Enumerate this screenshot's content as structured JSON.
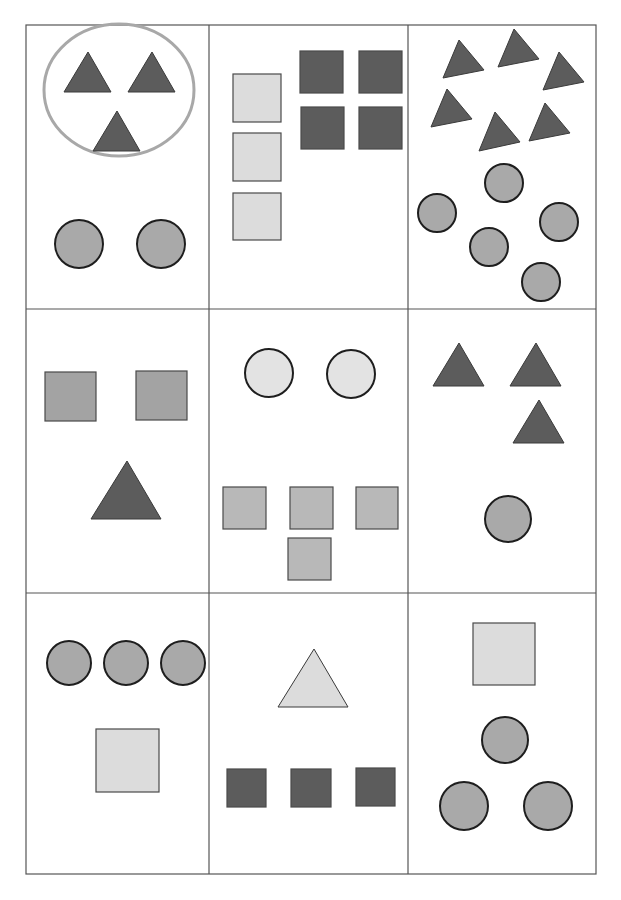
{
  "worksheet": {
    "title": "",
    "layout": {
      "rows": 3,
      "columns": 3
    },
    "colors": {
      "dark_gray": "#5c5c5c",
      "medium_gray": "#a3a3a3",
      "light_gray": "#dcdcdc",
      "circle_gray": "#a9a9a9",
      "light_circle": "#e3e3e3",
      "ring": "#a8a8a8"
    },
    "cells": [
      {
        "id": "cell-1",
        "grouped": {
          "shape": "triangle",
          "count": 3,
          "shade": "dark"
        },
        "items": [
          {
            "shape": "triangle",
            "count": 3,
            "shade": "dark"
          },
          {
            "shape": "circle",
            "count": 2,
            "shade": "medium"
          }
        ]
      },
      {
        "id": "cell-2",
        "items": [
          {
            "shape": "square",
            "count": 3,
            "shade": "light"
          },
          {
            "shape": "square",
            "count": 4,
            "shade": "dark"
          }
        ]
      },
      {
        "id": "cell-3",
        "items": [
          {
            "shape": "triangle",
            "count": 6,
            "shade": "dark"
          },
          {
            "shape": "circle",
            "count": 5,
            "shade": "medium"
          }
        ]
      },
      {
        "id": "cell-4",
        "items": [
          {
            "shape": "square",
            "count": 2,
            "shade": "medium"
          },
          {
            "shape": "triangle",
            "count": 1,
            "shade": "dark"
          }
        ]
      },
      {
        "id": "cell-5",
        "items": [
          {
            "shape": "circle",
            "count": 2,
            "shade": "light"
          },
          {
            "shape": "square",
            "count": 4,
            "shade": "medium"
          }
        ]
      },
      {
        "id": "cell-6",
        "items": [
          {
            "shape": "triangle",
            "count": 3,
            "shade": "dark"
          },
          {
            "shape": "circle",
            "count": 1,
            "shade": "medium"
          }
        ]
      },
      {
        "id": "cell-7",
        "items": [
          {
            "shape": "circle",
            "count": 3,
            "shade": "medium"
          },
          {
            "shape": "square",
            "count": 1,
            "shade": "light"
          }
        ]
      },
      {
        "id": "cell-8",
        "items": [
          {
            "shape": "triangle",
            "count": 1,
            "shade": "light"
          },
          {
            "shape": "square",
            "count": 3,
            "shade": "dark"
          }
        ]
      },
      {
        "id": "cell-9",
        "items": [
          {
            "shape": "square",
            "count": 1,
            "shade": "light"
          },
          {
            "shape": "circle",
            "count": 3,
            "shade": "medium"
          }
        ]
      }
    ]
  }
}
